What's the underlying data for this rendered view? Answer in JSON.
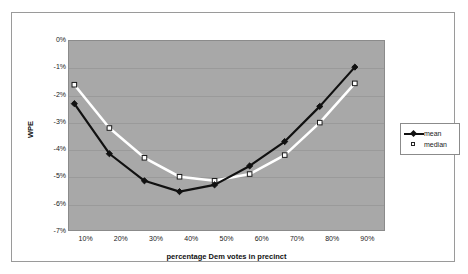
{
  "chart_data": {
    "type": "line",
    "title": "",
    "xlabel": "percentage Dem votes in precinct",
    "ylabel": "WPE",
    "x": [
      10,
      20,
      30,
      40,
      50,
      60,
      70,
      80,
      90
    ],
    "categories": [
      "10%",
      "20%",
      "30%",
      "40%",
      "50%",
      "60%",
      "70%",
      "80%",
      "90%"
    ],
    "series": [
      {
        "name": "mean",
        "color": "#111111",
        "marker": "filled-diamond",
        "values": [
          -2.8,
          -4.65,
          -5.65,
          -6.05,
          -5.8,
          -5.1,
          -4.2,
          -2.9,
          -1.45
        ]
      },
      {
        "name": "median",
        "color": "#ffffff",
        "marker": "open-square",
        "values": [
          -2.1,
          -3.7,
          -4.8,
          -5.5,
          -5.65,
          -5.4,
          -4.7,
          -3.5,
          -2.05
        ]
      }
    ],
    "ylim": [
      -7,
      0
    ],
    "xlim": [
      5,
      95
    ],
    "y_ticks": [
      0,
      -1,
      -2,
      -3,
      -4,
      -5,
      -6,
      -7
    ],
    "y_tick_labels": [
      "0%",
      "-1%",
      "-2%",
      "-3%",
      "-4%",
      "-5%",
      "-6%",
      "-7%"
    ],
    "grid": true,
    "legend_position": "right",
    "plot_background": "#a8a8a8",
    "figure_background": "#ffffff"
  },
  "axes": {
    "y_title": "WPE",
    "x_title": "percentage Dem votes in precinct"
  },
  "legend": {
    "entries": [
      {
        "label": "mean"
      },
      {
        "label": "median"
      }
    ]
  }
}
